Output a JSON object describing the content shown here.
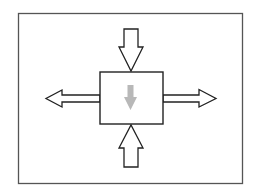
{
  "diagram": {
    "colors": {
      "background": "#ffffff",
      "frame_stroke": "#555555",
      "shape_stroke": "#222222",
      "shape_fill": "#ffffff",
      "inner_arrow_fill": "#b8b8b8"
    },
    "elements": {
      "frame": {
        "x": 18,
        "y": 13,
        "width": 224,
        "height": 170
      },
      "center_box": {
        "x": 100,
        "y": 72,
        "width": 63,
        "height": 52
      },
      "arrow_top": {
        "direction": "down",
        "role": "inward"
      },
      "arrow_bottom": {
        "direction": "up",
        "role": "inward"
      },
      "arrow_left": {
        "direction": "left",
        "role": "outward"
      },
      "arrow_right": {
        "direction": "right",
        "role": "outward"
      },
      "inner_arrow": {
        "direction": "down",
        "color": "gray"
      }
    }
  }
}
